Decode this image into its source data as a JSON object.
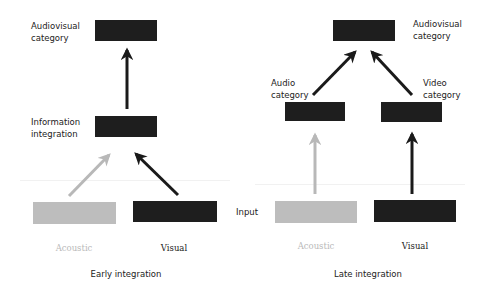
{
  "colors": {
    "dark_box": "#1e1e1e",
    "light_box": "#bdbdbd",
    "dark_arrow": "#1a1a1a",
    "light_arrow": "#b8b8b8",
    "faint_text": "#b9b9b9",
    "text": "#222222"
  },
  "early": {
    "title": "Early integration",
    "top_label_line1": "Audiovisual",
    "top_label_line2": "category",
    "mid_label_line1": "Information",
    "mid_label_line2": "integration",
    "acoustic_label": "Acoustic",
    "visual_label": "Visual"
  },
  "late": {
    "title": "Late integration",
    "top_label_line1": "Audiovisual",
    "top_label_line2": "category",
    "audio_label_line1": "Audio",
    "audio_label_line2": "category",
    "video_label_line1": "Video",
    "video_label_line2": "category",
    "acoustic_label": "Acoustic",
    "visual_label": "Visual"
  },
  "shared": {
    "input_label": "Input"
  }
}
